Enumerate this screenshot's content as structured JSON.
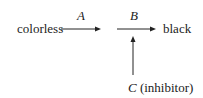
{
  "diagram": {
    "start_label": "colorless",
    "end_label": "black",
    "arrow_a_label": "A",
    "arrow_b_label": "B",
    "inhibitor_letter": "C",
    "inhibitor_text": "(inhibitor)",
    "line_color": "#222222"
  }
}
